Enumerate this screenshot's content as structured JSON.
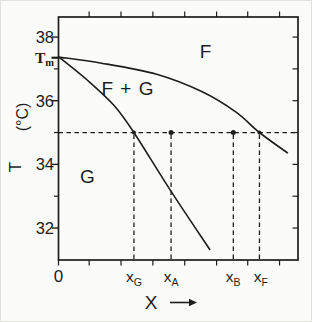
{
  "figure": {
    "background": "#fbfbf9",
    "ink_color": "#1d1d1b"
  },
  "chart_data": {
    "type": "line",
    "title": "",
    "xlabel": "X",
    "ylabel_parts": [
      "(°C)",
      "T"
    ],
    "xlim": [
      0,
      1
    ],
    "ylim": [
      31.0,
      38.6
    ],
    "grid": false,
    "y_axis": {
      "major_ticks": [
        38,
        36,
        34,
        32
      ],
      "minor_ticks": [
        37,
        35,
        33
      ],
      "melting_point": {
        "main": "T",
        "sub": "m",
        "T": 37.35
      }
    },
    "right_axis_minor_ticks": [
      38,
      37,
      36,
      35,
      34,
      33,
      32
    ],
    "shared_unlabeled_ticks_x": [
      0.128,
      0.261,
      0.394,
      0.527,
      0.66,
      0.79,
      0.923
    ],
    "bottom_origin_tick_x": 0,
    "x_tick_labels": [
      {
        "main": "0",
        "sub": "",
        "x": 0.0
      },
      {
        "main": "x",
        "sub": "G",
        "x": 0.315
      },
      {
        "main": "x",
        "sub": "A",
        "x": 0.47
      },
      {
        "main": "x",
        "sub": "B",
        "x": 0.729
      },
      {
        "main": "x",
        "sub": "F",
        "x": 0.845
      }
    ],
    "x_axis_has_arrow": true,
    "series": [
      {
        "name": "upper-boundary-F-liquidus",
        "points": [
          [
            0.002,
            37.37
          ],
          [
            0.18,
            37.18
          ],
          [
            0.41,
            36.83
          ],
          [
            0.6,
            36.28
          ],
          [
            0.74,
            35.65
          ],
          [
            0.839,
            35.0
          ],
          [
            0.958,
            34.35
          ]
        ]
      },
      {
        "name": "lower-boundary-G-solidus",
        "points": [
          [
            0.002,
            37.37
          ],
          [
            0.12,
            36.65
          ],
          [
            0.232,
            35.85
          ],
          [
            0.315,
            35.0
          ],
          [
            0.47,
            33.15
          ],
          [
            0.633,
            31.31
          ]
        ]
      }
    ],
    "tie_line": {
      "T": 35.0,
      "style": "dashed",
      "x_from": 0,
      "x_to": 1
    },
    "dashed_verticals": [
      {
        "at": "xG",
        "x": 0.315
      },
      {
        "at": "xA",
        "x": 0.47
      },
      {
        "at": "xB",
        "x": 0.73
      },
      {
        "at": "xF",
        "x": 0.839
      }
    ],
    "point_markers": [
      {
        "at": "xA",
        "x": 0.47,
        "T": 35.0,
        "shape": "dot"
      },
      {
        "at": "xB",
        "x": 0.73,
        "T": 35.0,
        "shape": "dot"
      },
      {
        "at": "xG",
        "x": 0.315,
        "T": 35.0,
        "shape": "curve-intersection"
      },
      {
        "at": "xF",
        "x": 0.839,
        "T": 35.0,
        "shape": "curve-intersection"
      }
    ],
    "region_labels": [
      {
        "text": "F",
        "x": 0.616,
        "T": 37.55
      },
      {
        "text": "F + G",
        "x": 0.29,
        "T": 36.37
      },
      {
        "text": "G",
        "x": 0.123,
        "T": 33.63
      }
    ]
  }
}
